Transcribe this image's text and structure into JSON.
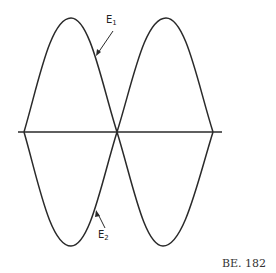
{
  "diagram": {
    "curves": [
      {
        "name": "E",
        "subscript": "1"
      },
      {
        "name": "E",
        "subscript": "2"
      }
    ],
    "figure_id": "BE. 182",
    "stroke_color": "#2a2a2a"
  }
}
